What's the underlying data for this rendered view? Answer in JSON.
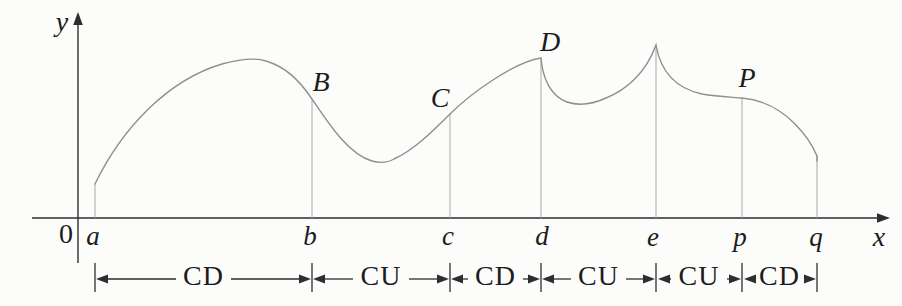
{
  "figure_type": "concavity-intervals-diagram",
  "colors": {
    "background": "#fcfcfb",
    "curve": "#8f8f8f",
    "guide_lines": "#a8a8a8",
    "ink": "#2e2e2e"
  },
  "axes": {
    "y_label": "y",
    "x_label": "x",
    "origin_label": "0"
  },
  "x_points": [
    {
      "label": "a"
    },
    {
      "label": "b"
    },
    {
      "label": "c"
    },
    {
      "label": "d"
    },
    {
      "label": "e"
    },
    {
      "label": "p"
    },
    {
      "label": "q"
    }
  ],
  "curve_labels": [
    {
      "label": "B"
    },
    {
      "label": "C"
    },
    {
      "label": "D"
    },
    {
      "label": "P"
    }
  ],
  "intervals": [
    {
      "from": "a",
      "to": "b",
      "label": "CD"
    },
    {
      "from": "b",
      "to": "c",
      "label": "CU"
    },
    {
      "from": "c",
      "to": "d",
      "label": "CD"
    },
    {
      "from": "d",
      "to": "e",
      "label": "CU"
    },
    {
      "from": "e",
      "to": "p",
      "label": "CU"
    },
    {
      "from": "p",
      "to": "q",
      "label": "CD"
    }
  ]
}
